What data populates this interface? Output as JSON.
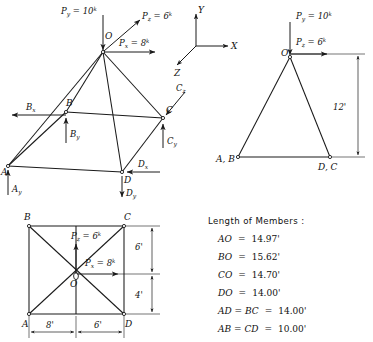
{
  "figure": {
    "background": "#ffffff",
    "ink": "#1a1a1a"
  },
  "iso_view": {
    "name": "isometric-space-frame",
    "joints": [
      {
        "id": "O",
        "label": "O"
      },
      {
        "id": "A",
        "label": "A"
      },
      {
        "id": "B",
        "label": "B"
      },
      {
        "id": "C",
        "label": "C"
      },
      {
        "id": "D",
        "label": "D"
      }
    ],
    "applied_loads": [
      {
        "id": "Py",
        "symbol": "P",
        "sub": "y",
        "eq": "=",
        "value": "10",
        "unit": "k",
        "dir": "down"
      },
      {
        "id": "Pz",
        "symbol": "P",
        "sub": "z",
        "eq": "=",
        "value": "6",
        "unit": "k",
        "dir": "up-right"
      },
      {
        "id": "Px",
        "symbol": "P",
        "sub": "x",
        "eq": "=",
        "value": "8",
        "unit": "k",
        "dir": "right"
      }
    ],
    "reactions": [
      {
        "id": "Bx",
        "symbol": "B",
        "sub": "x",
        "dir": "left"
      },
      {
        "id": "By",
        "symbol": "B",
        "sub": "y",
        "dir": "up"
      },
      {
        "id": "Ay",
        "symbol": "A",
        "sub": "y",
        "dir": "up"
      },
      {
        "id": "Cz",
        "symbol": "C",
        "sub": "z",
        "dir": "down-left"
      },
      {
        "id": "Cy",
        "symbol": "C",
        "sub": "y",
        "dir": "up"
      },
      {
        "id": "Dx",
        "symbol": "D",
        "sub": "x",
        "dir": "left"
      },
      {
        "id": "Dy",
        "symbol": "D",
        "sub": "y",
        "dir": "down"
      }
    ]
  },
  "axes": {
    "name": "coordinate-triad",
    "x_label": "X",
    "y_label": "Y",
    "z_label": "Z"
  },
  "elevation_view": {
    "name": "elevation-view",
    "apex_label": "O",
    "left_base_label": "A, B",
    "right_base_label": "D, C",
    "height_dim": "12'",
    "loads": [
      {
        "id": "Py",
        "symbol": "P",
        "sub": "y",
        "eq": "=",
        "value": "10",
        "unit": "k",
        "dir": "down"
      },
      {
        "id": "Pz",
        "symbol": "P",
        "sub": "z",
        "eq": "=",
        "value": "6",
        "unit": "k",
        "dir": "right"
      }
    ]
  },
  "plan_view": {
    "name": "plan-view",
    "corner_labels": {
      "top_left": "B",
      "top_right": "C",
      "bottom_left": "A",
      "bottom_right": "D",
      "center": "O"
    },
    "loads": [
      {
        "id": "Pz",
        "symbol": "P",
        "sub": "z",
        "eq": "=",
        "value": "6",
        "unit": "k",
        "dir": "up"
      },
      {
        "id": "Px",
        "symbol": "P",
        "sub": "x",
        "eq": "=",
        "value": "8",
        "unit": "k",
        "dir": "right"
      }
    ],
    "dimensions": {
      "horizontal_left": "8'",
      "horizontal_right": "6'",
      "vertical_top": "6'",
      "vertical_bottom": "4'"
    }
  },
  "legend": {
    "name": "length-of-members-legend",
    "heading": "Length of Members :",
    "rows": [
      {
        "member": "AO",
        "eq": "=",
        "value": "14.97'"
      },
      {
        "member": "BO",
        "eq": "=",
        "value": "15.62'"
      },
      {
        "member": "CO",
        "eq": "=",
        "value": "14.70'"
      },
      {
        "member": "DO",
        "eq": "=",
        "value": "14.00'"
      },
      {
        "member": "AD = BC",
        "eq": "=",
        "value": "14.00'"
      },
      {
        "member": "AB = CD",
        "eq": "=",
        "value": "10.00'"
      }
    ]
  }
}
